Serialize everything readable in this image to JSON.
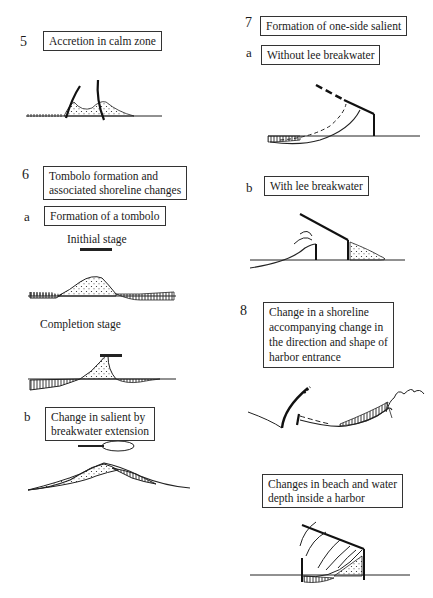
{
  "sections": {
    "s5": {
      "number": "5",
      "title": "Accretion in calm zone"
    },
    "s6": {
      "number": "6",
      "title_line1": "Tombolo formation and",
      "title_line2": "associated shoreline changes",
      "a": {
        "letter": "a",
        "title": "Formation of a tombolo",
        "initial_caption": "Inithial stage",
        "completion_caption": "Completion stage"
      },
      "b": {
        "letter": "b",
        "title_line1": "Change in salient by",
        "title_line2": "breakwater extension"
      }
    },
    "s7": {
      "number": "7",
      "title": "Formation of one-side salient",
      "a": {
        "letter": "a",
        "title": "Without lee breakwater"
      },
      "b": {
        "letter": "b",
        "title": "With lee breakwater"
      }
    },
    "s8": {
      "number": "8",
      "title_line1": "Change in a shoreline",
      "title_line2": "accompanying change in",
      "title_line3": "the direction and shape of",
      "title_line4": "harbor entrance",
      "harbor": {
        "title_line1": "Changes in beach and water",
        "title_line2": "depth inside a harbor"
      }
    }
  },
  "legend": {
    "dotted_fill": "accretion",
    "hatched_fill": "erosion"
  }
}
